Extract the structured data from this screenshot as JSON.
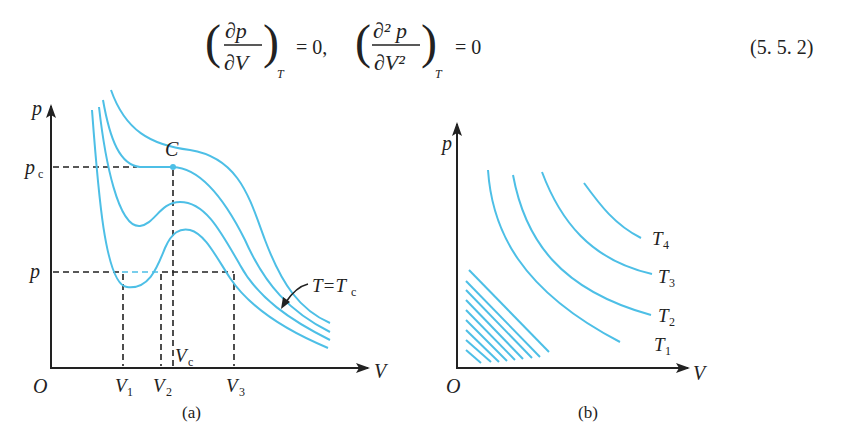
{
  "equation": {
    "lhs1_num": "∂p",
    "lhs1_den": "∂V",
    "sub1": "T",
    "eq1": "= 0,",
    "lhs2_num": "∂² p",
    "lhs2_den": "∂V²",
    "sub2": "T",
    "eq2": "= 0",
    "number": "(5. 5. 2)"
  },
  "figure_a": {
    "caption": "(a)",
    "y_axis_label": "p",
    "x_axis_label": "V",
    "origin_label": "O",
    "pc_label": "p",
    "pc_sub": "c",
    "p_label": "p",
    "critical_point_label": "C",
    "v1_label": "V",
    "v1_sub": "1",
    "v2_label": "V",
    "v2_sub": "2",
    "v3_label": "V",
    "v3_sub": "3",
    "vc_label": "V",
    "vc_sub": "c",
    "tc_label": "T=T",
    "tc_sub": "c"
  },
  "figure_b": {
    "caption": "(b)",
    "y_axis_label": "p",
    "x_axis_label": "V",
    "origin_label": "O",
    "isotherms": [
      {
        "label": "T",
        "sub": "1"
      },
      {
        "label": "T",
        "sub": "2"
      },
      {
        "label": "T",
        "sub": "3"
      },
      {
        "label": "T",
        "sub": "4"
      }
    ]
  },
  "colors": {
    "curve": "#4dbfe6",
    "ink": "#222222"
  }
}
